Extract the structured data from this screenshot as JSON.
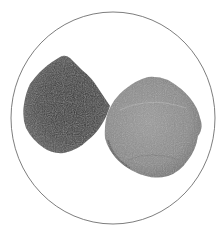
{
  "image": {
    "description": "Grayscale photograph of two seeds or stones inside a thin circular outline on a white background",
    "background": "#ffffff",
    "circle": {
      "cx": 113,
      "cy": 118,
      "rx": 102,
      "ry": 106,
      "stroke": "#6e6e6e"
    },
    "objects": [
      {
        "name": "left-seed",
        "tone": "dark",
        "fill": "#454545",
        "highlight": "#6a6a6a"
      },
      {
        "name": "right-seed",
        "tone": "light",
        "fill": "#8a8a8a",
        "highlight": "#a8a8a8"
      }
    ]
  }
}
